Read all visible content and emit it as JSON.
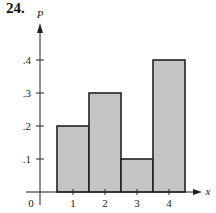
{
  "problem_number": "24.",
  "chart_data": {
    "type": "bar",
    "title": "",
    "xlabel": "x",
    "ylabel": "P",
    "categories": [
      "1",
      "2",
      "3",
      "4"
    ],
    "x": [
      1,
      2,
      3,
      4
    ],
    "values": [
      0.2,
      0.3,
      0.1,
      0.4
    ],
    "bar_width": 1,
    "xlim": [
      0,
      4.9
    ],
    "ylim": [
      0,
      0.45
    ],
    "x_ticks": [
      "1",
      "2",
      "3",
      "4"
    ],
    "y_ticks": [
      ".1",
      ".2",
      ".3",
      ".4"
    ],
    "origin_label": "0",
    "grid": false,
    "legend": null,
    "bar_color": "#c4c4c4",
    "edge_color": "#222222"
  }
}
